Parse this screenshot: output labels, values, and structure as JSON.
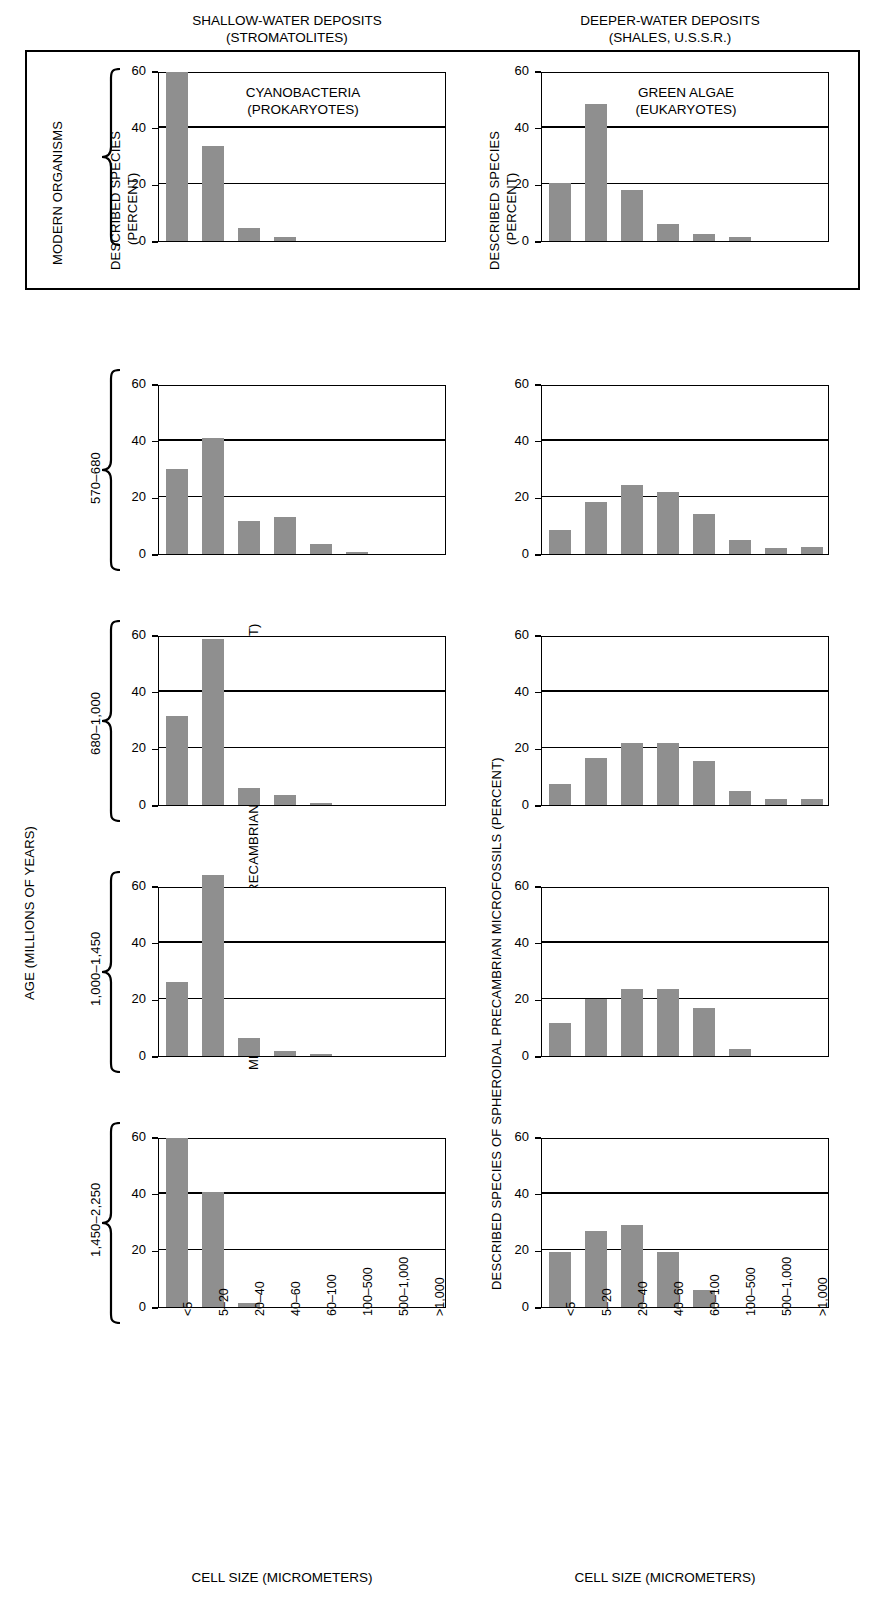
{
  "figure": {
    "column_headers": [
      {
        "line1": "SHALLOW-WATER DEPOSITS",
        "line2": "(STROMATOLITES)"
      },
      {
        "line1": "DEEPER-WATER DEPOSITS",
        "line2": "(SHALES, U.S.S.R.)"
      }
    ],
    "left_axis_title": "AGE (MILLIONS OF YEARS)",
    "left_group_label": "MODERN ORGANISMS",
    "left_value_axis_modern": {
      "line1": "DESCRIBED SPECIES",
      "line2": "(PERCENT)"
    },
    "left_value_axis_fossil": "MEASURED SPHEROIDAL PRECAMBRIAN MICROFOSSILS (PERCENT)",
    "right_value_axis_modern": {
      "line1": "DESCRIBED SPECIES",
      "line2": "(PERCENT)"
    },
    "right_value_axis_fossil": "DESCRIBED SPECIES OF SPHEROIDAL PRECAMBRIAN MICROFOSSILS (PERCENT)",
    "xaxis_title_left": "CELL SIZE (MICROMETERS)",
    "xaxis_title_right": "CELL SIZE (MICROMETERS)",
    "age_labels": [
      "570–680",
      "680–1,000",
      "1,000–1,450",
      "1,450–2,250"
    ],
    "panel_titles": [
      {
        "line1": "CYANOBACTERIA",
        "line2": "(PROKARYOTES)"
      },
      {
        "line1": "GREEN ALGAE",
        "line2": "(EUKARYOTES)"
      }
    ],
    "bar_color": "#8f8f8f",
    "axis_color": "#000000"
  },
  "chart_data": {
    "type": "bar",
    "categories": [
      "<5",
      "5–20",
      "20–40",
      "40–60",
      "60–100",
      "100–500",
      "500–1,000",
      ">1,000"
    ],
    "xlabel": "CELL SIZE (MICROMETERS)",
    "ylabel": "PERCENT",
    "ylim": [
      0,
      60
    ],
    "yticks": [
      0,
      20,
      40,
      60
    ],
    "grid": true,
    "legend": "none",
    "panels": [
      {
        "row": "MODERN ORGANISMS",
        "column": "SHALLOW-WATER DEPOSITS (STROMATOLITES)",
        "title": "CYANOBACTERIA (PROKARYOTES)",
        "ylabel": "DESCRIBED SPECIES (PERCENT)",
        "values": [
          59.5,
          33.5,
          4.5,
          1.5,
          0,
          0,
          0,
          0
        ]
      },
      {
        "row": "MODERN ORGANISMS",
        "column": "DEEPER-WATER DEPOSITS (SHALES, U.S.S.R.)",
        "title": "GREEN ALGAE (EUKARYOTES)",
        "ylabel": "DESCRIBED SPECIES (PERCENT)",
        "values": [
          20.5,
          48.5,
          18.0,
          6.0,
          2.5,
          1.5,
          0,
          0
        ]
      },
      {
        "row": "570–680",
        "column": "SHALLOW-WATER DEPOSITS (STROMATOLITES)",
        "title": "",
        "ylabel": "MEASURED SPHEROIDAL PRECAMBRIAN MICROFOSSILS (PERCENT)",
        "values": [
          30.0,
          41.0,
          11.5,
          13.0,
          3.5,
          0.8,
          0,
          0
        ]
      },
      {
        "row": "570–680",
        "column": "DEEPER-WATER DEPOSITS (SHALES, U.S.S.R.)",
        "title": "",
        "ylabel": "DESCRIBED SPECIES OF SPHEROIDAL PRECAMBRIAN MICROFOSSILS (PERCENT)",
        "values": [
          8.5,
          18.5,
          24.5,
          22.0,
          14.0,
          5.0,
          2.0,
          2.5
        ]
      },
      {
        "row": "680–1,000",
        "column": "SHALLOW-WATER DEPOSITS (STROMATOLITES)",
        "title": "",
        "ylabel": "MEASURED SPHEROIDAL PRECAMBRIAN MICROFOSSILS (PERCENT)",
        "values": [
          31.5,
          58.5,
          6.0,
          3.5,
          0.8,
          0,
          0,
          0
        ]
      },
      {
        "row": "680–1,000",
        "column": "DEEPER-WATER DEPOSITS (SHALES, U.S.S.R.)",
        "title": "",
        "ylabel": "DESCRIBED SPECIES OF SPHEROIDAL PRECAMBRIAN MICROFOSSILS (PERCENT)",
        "values": [
          7.5,
          16.5,
          22.0,
          22.0,
          15.5,
          5.0,
          2.0,
          2.0
        ]
      },
      {
        "row": "1,000–1,450",
        "column": "SHALLOW-WATER DEPOSITS (STROMATOLITES)",
        "title": "",
        "ylabel": "MEASURED SPHEROIDAL PRECAMBRIAN MICROFOSSILS (PERCENT)",
        "values": [
          26.0,
          64.0,
          6.5,
          1.8,
          0.8,
          0,
          0,
          0
        ]
      },
      {
        "row": "1,000–1,450",
        "column": "DEEPER-WATER DEPOSITS (SHALES, U.S.S.R.)",
        "title": "",
        "ylabel": "DESCRIBED SPECIES OF SPHEROIDAL PRECAMBRIAN MICROFOSSILS (PERCENT)",
        "values": [
          11.5,
          20.0,
          23.5,
          23.5,
          17.0,
          2.5,
          0,
          0
        ]
      },
      {
        "row": "1,450–2,250",
        "column": "SHALLOW-WATER DEPOSITS (STROMATOLITES)",
        "title": "",
        "ylabel": "MEASURED SPHEROIDAL PRECAMBRIAN MICROFOSSILS (PERCENT)",
        "values": [
          59.5,
          40.5,
          1.5,
          0,
          0,
          0,
          0,
          0
        ]
      },
      {
        "row": "1,450–2,250",
        "column": "DEEPER-WATER DEPOSITS (SHALES, U.S.S.R.)",
        "title": "",
        "ylabel": "DESCRIBED SPECIES OF SPHEROIDAL PRECAMBRIAN MICROFOSSILS (PERCENT)",
        "values": [
          19.5,
          27.0,
          29.0,
          19.5,
          6.0,
          0,
          0,
          0
        ]
      }
    ]
  }
}
